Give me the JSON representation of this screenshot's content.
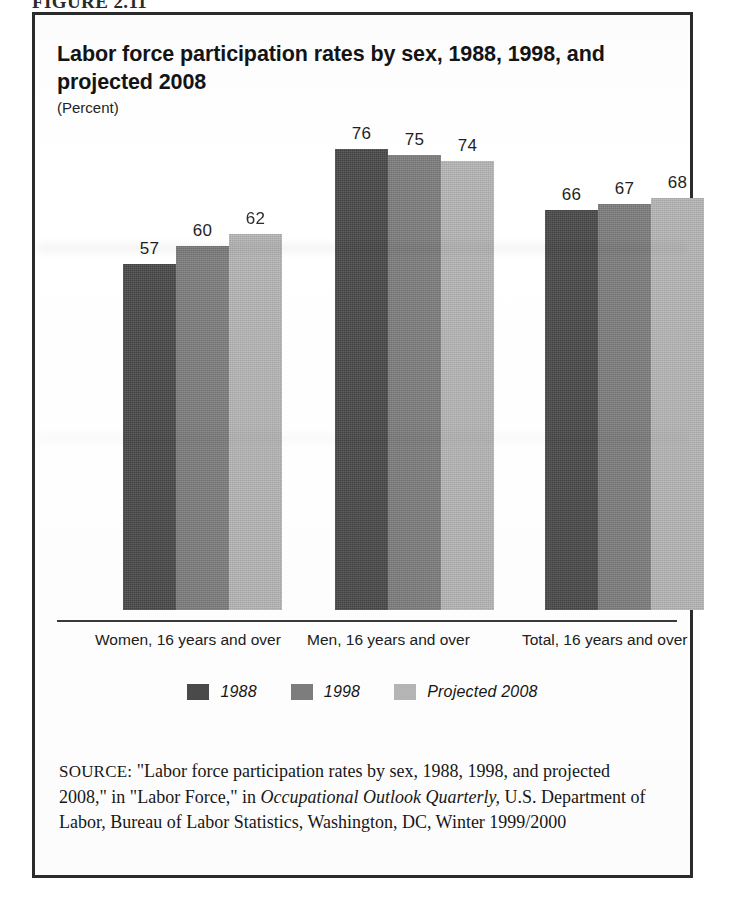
{
  "figure": {
    "number_label": "FIGURE 2.11"
  },
  "chart": {
    "title": "Labor force participation rates by sex, 1988, 1998, and projected 2008",
    "subtitle": "(Percent)"
  },
  "legend": {
    "items": [
      {
        "label": "1988",
        "color": "#4a4a4a",
        "swatch_name": "legend-swatch-1988"
      },
      {
        "label": "1998",
        "color": "#7e7e7e",
        "swatch_name": "legend-swatch-1998"
      },
      {
        "label": "Projected 2008",
        "color": "#b6b6b6",
        "swatch_name": "legend-swatch-projected-2008"
      }
    ]
  },
  "source": {
    "label": "SOURCE:",
    "text_part1": " \"Labor force participation rates by sex, 1988, 1998, and projected 2008,\" in \"Labor Force,\" in ",
    "italic1": "Occupational Outlook Quarterly,",
    "text_part2": " U.S. Department of Labor, Bureau of Labor Statistics, Washington, DC, Winter 1999/2000"
  },
  "chart_data": {
    "type": "bar",
    "title": "Labor force participation rates by sex, 1988, 1998, and projected 2008",
    "subtitle": "(Percent)",
    "xlabel": "",
    "ylabel": "Percent",
    "ylim": [
      0,
      80
    ],
    "grid": false,
    "legend_position": "bottom",
    "categories": [
      "Women, 16 years and over",
      "Men, 16 years and over",
      "Total, 16 years and over"
    ],
    "series": [
      {
        "name": "1988",
        "color": "#4a4a4a",
        "values": [
          57,
          76,
          66
        ]
      },
      {
        "name": "1998",
        "color": "#7e7e7e",
        "values": [
          60,
          75,
          67
        ]
      },
      {
        "name": "Projected 2008",
        "color": "#b6b6b6",
        "values": [
          62,
          74,
          68
        ]
      }
    ],
    "value_label_notes": {
      "Women/Projected 2008": "printed label obscured by scan artifact; reads as 62"
    }
  }
}
